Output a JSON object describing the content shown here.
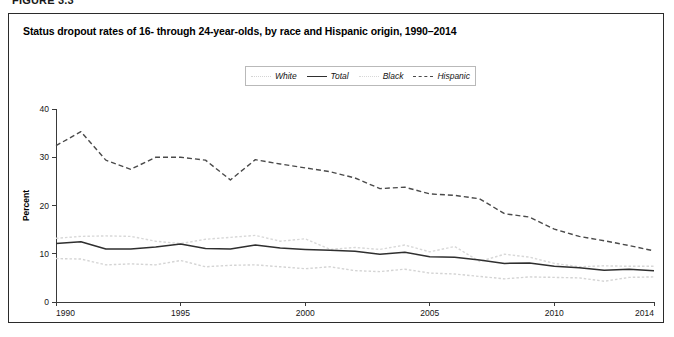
{
  "figure": {
    "number_label": "FIGURE 3.3",
    "title": "Status dropout rates of 16- through 24-year-olds, by race and Hispanic origin, 1990–2014"
  },
  "legend": {
    "position": "top-center",
    "items": [
      {
        "label": "White",
        "style": "dotted",
        "color": "#d4d4d4",
        "swatch_icon": "line-dotted-icon"
      },
      {
        "label": "Total",
        "style": "solid",
        "color": "#2f2f2f",
        "swatch_icon": "line-solid-icon"
      },
      {
        "label": "Black",
        "style": "dotted",
        "color": "#d8d8d8",
        "swatch_icon": "line-dotted-icon"
      },
      {
        "label": "Hispanic",
        "style": "dashed",
        "color": "#4a4a4a",
        "swatch_icon": "line-dashed-icon"
      }
    ]
  },
  "axes": {
    "x": {
      "label": "Year",
      "ticks": [
        "1990",
        "1995",
        "2000",
        "2005",
        "2010",
        "2014"
      ],
      "min": 1990,
      "max": 2014
    },
    "y": {
      "label": "Percent",
      "ticks": [
        "0",
        "10",
        "20",
        "30",
        "40"
      ],
      "min": 0,
      "max": 40
    }
  },
  "chart_data": {
    "type": "line",
    "title": "Status dropout rates of 16- through 24-year-olds, by race and Hispanic origin, 1990–2014",
    "xlabel": "Year",
    "ylabel": "Percent",
    "xlim": [
      1990,
      2014
    ],
    "ylim": [
      0,
      40
    ],
    "grid": false,
    "legend_position": "top-center",
    "x": [
      1990,
      1991,
      1992,
      1993,
      1994,
      1995,
      1996,
      1997,
      1998,
      1999,
      2000,
      2001,
      2002,
      2003,
      2004,
      2005,
      2006,
      2007,
      2008,
      2009,
      2010,
      2011,
      2012,
      2013,
      2014
    ],
    "series": [
      {
        "name": "Total",
        "style": "solid",
        "color": "#2f2f2f",
        "values": [
          12.1,
          12.5,
          11.0,
          11.0,
          11.4,
          12.0,
          11.1,
          11.0,
          11.8,
          11.2,
          10.9,
          10.7,
          10.5,
          9.9,
          10.3,
          9.4,
          9.3,
          8.7,
          8.0,
          8.1,
          7.4,
          7.1,
          6.6,
          6.8,
          6.5
        ]
      },
      {
        "name": "White",
        "style": "dotted",
        "color": "#d4d4d4",
        "values": [
          9.0,
          8.9,
          7.7,
          7.9,
          7.7,
          8.6,
          7.3,
          7.6,
          7.7,
          7.3,
          6.9,
          7.3,
          6.5,
          6.3,
          6.8,
          6.0,
          5.8,
          5.3,
          4.8,
          5.2,
          5.1,
          5.0,
          4.3,
          5.1,
          5.2
        ]
      },
      {
        "name": "Black",
        "style": "dotted",
        "color": "#d8d8d8",
        "values": [
          13.2,
          13.6,
          13.7,
          13.6,
          12.6,
          12.1,
          13.0,
          13.4,
          13.8,
          12.6,
          13.1,
          10.9,
          11.3,
          10.9,
          11.8,
          10.4,
          11.5,
          8.4,
          9.9,
          9.3,
          8.0,
          7.3,
          7.5,
          7.4,
          7.4
        ]
      },
      {
        "name": "Hispanic",
        "style": "dashed",
        "color": "#4a4a4a",
        "values": [
          32.4,
          35.3,
          29.4,
          27.5,
          30.0,
          30.0,
          29.4,
          25.3,
          29.5,
          28.6,
          27.8,
          27.0,
          25.7,
          23.5,
          23.8,
          22.4,
          22.1,
          21.4,
          18.3,
          17.6,
          15.1,
          13.6,
          12.7,
          11.7,
          10.6
        ]
      }
    ]
  }
}
